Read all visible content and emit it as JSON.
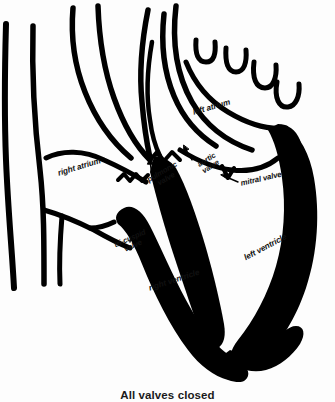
{
  "figure": {
    "kind": "anatomical-diagram",
    "caption": "All valves closed",
    "colors": {
      "ink": "#000000",
      "background": "#fdfdfd",
      "label_text": "#111111"
    },
    "labels": [
      {
        "id": "right-atrium",
        "text": "right atrium",
        "x": 57,
        "y": 170,
        "rotate": -17,
        "size": 8.2
      },
      {
        "id": "left-atrium",
        "text": "left atrium",
        "x": 192,
        "y": 109,
        "rotate": -16,
        "size": 8.2
      },
      {
        "id": "pulmonic-valve",
        "line1": "pulmonic",
        "line2": "valve",
        "x": 146,
        "y": 177,
        "rotate": -30,
        "size": 7.6
      },
      {
        "id": "aortic-valve",
        "line1": "aortic",
        "line2": "valve",
        "x": 196,
        "y": 162,
        "rotate": -32,
        "size": 7.6
      },
      {
        "id": "mitral-valve",
        "text": "mitral valve",
        "x": 240,
        "y": 180,
        "rotate": -13,
        "size": 7.8
      },
      {
        "id": "tricuspid-valve",
        "line1": "tri-cuspid",
        "line2": "valve",
        "x": 113,
        "y": 242,
        "rotate": -24,
        "size": 7.6
      },
      {
        "id": "right-ventricle",
        "text": "right ventricle",
        "x": 148,
        "y": 285,
        "rotate": -18,
        "size": 8.2
      },
      {
        "id": "left-ventricle",
        "text": "left ventricle",
        "x": 243,
        "y": 255,
        "rotate": -28,
        "size": 8.2
      }
    ],
    "structures": [
      "superior vena cava",
      "aorta",
      "pulmonary artery",
      "pulmonary veins",
      "right atrium",
      "left atrium",
      "right ventricle",
      "left ventricle",
      "interventricular septum"
    ]
  }
}
